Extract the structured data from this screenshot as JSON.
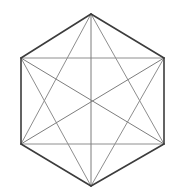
{
  "figure": {
    "background_color": "#ffffff",
    "canvas": {
      "width": 174,
      "height": 194
    },
    "shape_type": "polygon-complete-graph",
    "sides": 6,
    "vertex_count": 6,
    "edge_count_outline": 6,
    "diagonal_count": 9,
    "total_segments": 15,
    "outline_color": "#3c3c3c",
    "diagonal_color": "#8e8e8e",
    "long_diagonal_color": "#7d7d7d",
    "outline_width": 1.6,
    "diagonal_width": 1.0,
    "vertices": [
      {
        "name": "top",
        "index": 0,
        "x": 91,
        "y": 14
      },
      {
        "name": "upper-right",
        "index": 1,
        "x": 164,
        "y": 58
      },
      {
        "name": "lower-right",
        "index": 2,
        "x": 164,
        "y": 144
      },
      {
        "name": "bottom",
        "index": 3,
        "x": 91,
        "y": 186
      },
      {
        "name": "lower-left",
        "index": 4,
        "x": 21,
        "y": 144
      },
      {
        "name": "upper-left",
        "index": 5,
        "x": 21,
        "y": 58
      }
    ],
    "center": {
      "x": 91,
      "y": 101
    },
    "outline_edges": [
      {
        "name": "edge-top-to-upper-right",
        "from": 0,
        "to": 1
      },
      {
        "name": "edge-upper-right-to-lower-right",
        "from": 1,
        "to": 2
      },
      {
        "name": "edge-lower-right-to-bottom",
        "from": 2,
        "to": 3
      },
      {
        "name": "edge-bottom-to-lower-left",
        "from": 3,
        "to": 4
      },
      {
        "name": "edge-lower-left-to-upper-left",
        "from": 4,
        "to": 5
      },
      {
        "name": "edge-upper-left-to-top",
        "from": 5,
        "to": 0
      }
    ],
    "long_diagonals": [
      {
        "name": "diagonal-top-to-bottom",
        "from": 0,
        "to": 3
      },
      {
        "name": "diagonal-upper-right-to-lower-left",
        "from": 1,
        "to": 4
      },
      {
        "name": "diagonal-lower-right-to-upper-left",
        "from": 2,
        "to": 5
      }
    ],
    "short_diagonals": [
      {
        "name": "diagonal-top-to-lower-right",
        "from": 0,
        "to": 2
      },
      {
        "name": "diagonal-top-to-lower-left",
        "from": 0,
        "to": 4
      },
      {
        "name": "diagonal-upper-right-to-bottom",
        "from": 1,
        "to": 3
      },
      {
        "name": "diagonal-upper-right-to-upper-left",
        "from": 1,
        "to": 5
      },
      {
        "name": "diagonal-lower-right-to-lower-left",
        "from": 2,
        "to": 4
      },
      {
        "name": "diagonal-bottom-to-upper-left",
        "from": 3,
        "to": 5
      }
    ]
  }
}
